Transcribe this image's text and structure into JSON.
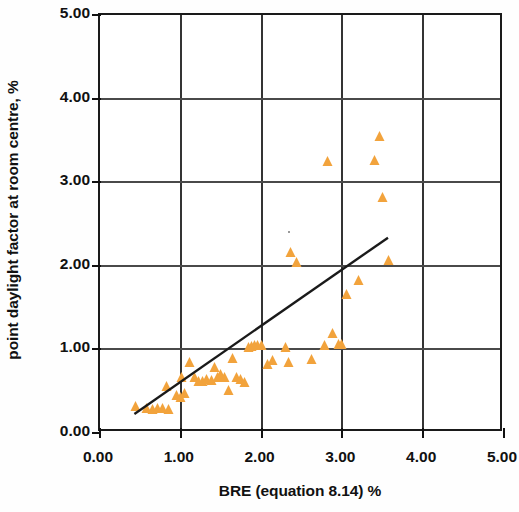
{
  "chart_data": {
    "type": "scatter",
    "title": "",
    "xlabel": "BRE (equation 8.14) %",
    "ylabel": "point daylight factor at room centre, %",
    "xlim": [
      0.0,
      5.0
    ],
    "ylim": [
      0.0,
      5.0
    ],
    "xticks": [
      "0.00",
      "1.00",
      "2.00",
      "3.00",
      "4.00",
      "5.00"
    ],
    "yticks": [
      "0.00",
      "1.00",
      "2.00",
      "3.00",
      "4.00",
      "5.00"
    ],
    "xtick_values": [
      0,
      1,
      2,
      3,
      4,
      5
    ],
    "ytick_values": [
      0,
      1,
      2,
      3,
      4,
      5
    ],
    "grid": true,
    "legend": "none",
    "marker_shape": "triangle",
    "marker_color": "#f2a33c",
    "line_color": "#1a1a1a",
    "series": [
      {
        "name": "measured points",
        "marker": "triangle",
        "color": "#f2a33c",
        "points": [
          [
            0.45,
            0.27
          ],
          [
            0.58,
            0.25
          ],
          [
            0.66,
            0.24
          ],
          [
            0.72,
            0.25
          ],
          [
            0.78,
            0.25
          ],
          [
            0.83,
            0.52
          ],
          [
            0.86,
            0.24
          ],
          [
            0.95,
            0.41
          ],
          [
            1.0,
            0.38
          ],
          [
            1.02,
            0.62
          ],
          [
            1.05,
            0.43
          ],
          [
            1.12,
            0.8
          ],
          [
            1.18,
            0.62
          ],
          [
            1.22,
            0.58
          ],
          [
            1.28,
            0.57
          ],
          [
            1.33,
            0.6
          ],
          [
            1.38,
            0.59
          ],
          [
            1.42,
            0.74
          ],
          [
            1.46,
            0.62
          ],
          [
            1.5,
            0.66
          ],
          [
            1.55,
            0.62
          ],
          [
            1.6,
            0.47
          ],
          [
            1.64,
            0.85
          ],
          [
            1.7,
            0.62
          ],
          [
            1.74,
            0.6
          ],
          [
            1.8,
            0.56
          ],
          [
            1.84,
            0.98
          ],
          [
            1.88,
            0.99
          ],
          [
            1.92,
            1.0
          ],
          [
            1.96,
            1.0
          ],
          [
            2.0,
            1.0
          ],
          [
            2.08,
            0.78
          ],
          [
            2.14,
            0.82
          ],
          [
            2.3,
            0.98
          ],
          [
            2.34,
            0.8
          ],
          [
            2.36,
            2.12
          ],
          [
            2.44,
            2.0
          ],
          [
            2.62,
            0.84
          ],
          [
            2.78,
            1.0
          ],
          [
            2.82,
            3.21
          ],
          [
            2.88,
            1.15
          ],
          [
            2.96,
            1.02
          ],
          [
            3.0,
            1.02
          ],
          [
            3.06,
            1.62
          ],
          [
            3.2,
            1.78
          ],
          [
            3.4,
            3.22
          ],
          [
            3.46,
            3.5
          ],
          [
            3.5,
            2.78
          ],
          [
            3.58,
            2.02
          ]
        ]
      }
    ],
    "trendline": {
      "name": "linear fit",
      "color": "#1a1a1a",
      "x_start": 0.43,
      "y_start": 0.18,
      "x_end": 3.6,
      "y_end": 2.31
    }
  }
}
